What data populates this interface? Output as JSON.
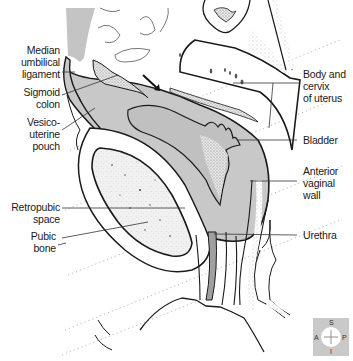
{
  "diagram": {
    "labels_left": [
      {
        "id": "median-umbilical-ligament",
        "text": "Median\numbilical\nligament"
      },
      {
        "id": "sigmoid-colon",
        "text": "Sigmoid\ncolon"
      },
      {
        "id": "vesico-uterine-pouch",
        "text": "Vesico-\nuterine\npouch"
      },
      {
        "id": "retropubic-space",
        "text": "Retropubic\nspace"
      },
      {
        "id": "pubic-bone",
        "text": "Pubic\nbone"
      }
    ],
    "labels_right": [
      {
        "id": "body-and-cervix-of-uterus",
        "text": "Body and\ncervix\nof uterus"
      },
      {
        "id": "bladder",
        "text": "Bladder"
      },
      {
        "id": "anterior-vaginal-wall",
        "text": "Anterior\nvaginal\nwall"
      },
      {
        "id": "urethra",
        "text": "Urethra"
      }
    ],
    "orientation": {
      "superior": "S",
      "inferior": "I",
      "anterior": "A",
      "posterior": "P"
    },
    "colors": {
      "tissue_grey": "#c8c8c8",
      "dark_grey": "#a0a0a0",
      "outline": "#1a1a1a",
      "stipple": "#888888",
      "background": "#ffffff"
    }
  }
}
